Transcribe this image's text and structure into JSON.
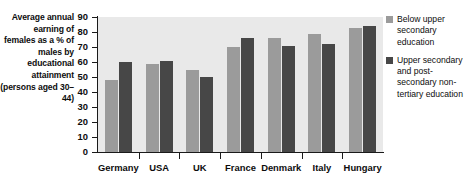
{
  "caption": "Average annual earning of females as a % of males by educational attainment (persons aged 30–44)",
  "legend": {
    "entries": [
      {
        "label": "Below upper secondary education",
        "color": "#9b9b9b",
        "swatch_name": "legend-swatch-below-upper-secondary"
      },
      {
        "label": "Upper secondary and post-secondary non-tertiary education",
        "color": "#474747",
        "swatch_name": "legend-swatch-upper-secondary"
      }
    ]
  },
  "chart_data": {
    "type": "bar",
    "title": "Average annual earning of females as a % of males by educational attainment (persons aged 30–44)",
    "xlabel": "",
    "ylabel": "",
    "ylim": [
      0,
      90
    ],
    "yticks": [
      0,
      10,
      20,
      30,
      40,
      50,
      60,
      70,
      80,
      90
    ],
    "grid": false,
    "legend_position": "right",
    "plot_background": "#e9e9e9",
    "categories": [
      "Germany",
      "USA",
      "UK",
      "France",
      "Denmark",
      "Italy",
      "Hungary"
    ],
    "series": [
      {
        "name": "Below upper secondary education",
        "color": "#9b9b9b",
        "values": [
          48,
          59,
          55,
          70,
          76,
          79,
          83
        ]
      },
      {
        "name": "Upper secondary and post-secondary non-tertiary education",
        "color": "#474747",
        "values": [
          60,
          61,
          50,
          76,
          71,
          72,
          84
        ]
      }
    ]
  }
}
